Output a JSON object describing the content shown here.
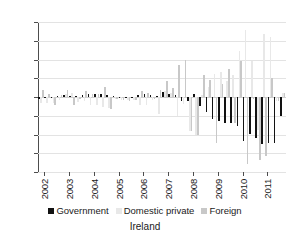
{
  "chart_data": {
    "type": "bar",
    "title": "Ireland",
    "xlabel": "",
    "ylabel": "",
    "ylim": [
      -40,
      40
    ],
    "yticks": [
      40,
      30,
      20,
      10,
      0,
      -10,
      -20,
      -30,
      -40
    ],
    "ytick_labels": [
      "40",
      "30",
      "20",
      "10",
      "0",
      "−10",
      "−20",
      "−30",
      "−40"
    ],
    "grid": true,
    "legend_position": "bottom",
    "categories": [
      "2002Q1",
      "2002Q2",
      "2002Q3",
      "2002Q4",
      "2003Q1",
      "2003Q2",
      "2003Q3",
      "2003Q4",
      "2004Q1",
      "2004Q2",
      "2004Q3",
      "2004Q4",
      "2005Q1",
      "2005Q2",
      "2005Q3",
      "2005Q4",
      "2006Q1",
      "2006Q2",
      "2006Q3",
      "2006Q4",
      "2007Q1",
      "2007Q2",
      "2007Q3",
      "2007Q4",
      "2008Q1",
      "2008Q2",
      "2008Q3",
      "2008Q4",
      "2009Q1",
      "2009Q2",
      "2009Q3",
      "2009Q4",
      "2010Q1",
      "2010Q2",
      "2010Q3",
      "2010Q4",
      "2011Q1",
      "2011Q2",
      "2011Q3",
      "2011Q4"
    ],
    "xtick_labels": [
      "2002",
      "2003",
      "2004",
      "2005",
      "2006",
      "2007",
      "2008",
      "2009",
      "2010",
      "2011"
    ],
    "series": [
      {
        "name": "Government",
        "color": "#121212",
        "values": [
          -1.0,
          -0.5,
          -0.5,
          0.5,
          1.0,
          0.5,
          0.5,
          1.0,
          1.5,
          1.5,
          1.5,
          1.0,
          0.5,
          -0.5,
          -0.5,
          -0.5,
          1.0,
          1.5,
          1.0,
          0.5,
          2.5,
          1.5,
          1.0,
          -2.0,
          -2.0,
          1.5,
          -5.0,
          -8.0,
          -11.5,
          -13.0,
          -14.0,
          -14.0,
          -15.5,
          -23.5,
          -19.5,
          -22.0,
          -25.0,
          -24.5,
          -24.5,
          -10.0
        ]
      },
      {
        "name": "Domestic private",
        "color": "#e8e8e8",
        "values": [
          -3.0,
          -3.0,
          -3.0,
          -1.5,
          1.5,
          2.0,
          -2.5,
          -2.0,
          -4.0,
          -4.5,
          -5.5,
          -6.0,
          -1.0,
          -1.5,
          -1.5,
          -1.5,
          -4.0,
          -4.5,
          -1.5,
          -9.0,
          3.0,
          2.0,
          -10.0,
          -3.5,
          -18.0,
          -20.0,
          1.0,
          5.5,
          12.5,
          13.5,
          8.5,
          11.5,
          24.5,
          36.0,
          19.0,
          -17.5,
          33.5,
          32.0,
          -2.0,
          2.0
        ]
      },
      {
        "name": "Foreign",
        "color": "#c8c8c8",
        "values": [
          4.0,
          1.5,
          -4.5,
          1.0,
          3.5,
          -4.0,
          -1.0,
          3.0,
          1.5,
          1.5,
          5.5,
          -6.5,
          -1.0,
          -1.5,
          -2.0,
          -1.5,
          3.0,
          2.0,
          -1.0,
          3.5,
          8.5,
          5.0,
          17.0,
          19.5,
          -18.0,
          -20.0,
          11.5,
          9.0,
          -24.5,
          7.0,
          15.0,
          -14.0,
          19.0,
          -35.5,
          -1.0,
          -33.5,
          -31.5,
          10.0,
          -2.0,
          2.0
        ]
      }
    ]
  },
  "legend": {
    "items": [
      {
        "label": "Government"
      },
      {
        "label": "Domestic private"
      },
      {
        "label": "Foreign"
      }
    ]
  },
  "footer": {
    "caption": "Ireland"
  }
}
